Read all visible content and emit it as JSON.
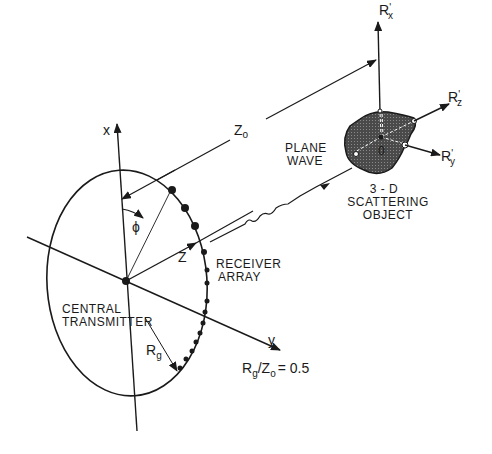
{
  "diagram": {
    "axes": {
      "x": "x",
      "y": "y",
      "z": "Z",
      "phi": "ϕ",
      "rx": "R",
      "rx_sub": "x",
      "ry": "R",
      "ry_sub": "y",
      "rz": "R",
      "rz_sub": "z",
      "prime": "'"
    },
    "labels": {
      "distance": "Z",
      "distance_sub": "o",
      "plane_wave_1": "PLANE",
      "plane_wave_2": "WAVE",
      "object_1": "3 - D",
      "object_2": "SCATTERING",
      "object_3": "OBJECT",
      "origin": "0",
      "receiver_1": "RECEIVER",
      "receiver_2": "ARRAY",
      "transmitter_1": "CENTRAL",
      "transmitter_2": "TRANSMITTER",
      "radius": "R",
      "radius_sub": "g",
      "ratio_r": "R",
      "ratio_r_sub": "g",
      "ratio_slash": "/",
      "ratio_z": "Z",
      "ratio_z_sub": "o",
      "ratio_value": "= 0.5"
    },
    "colors": {
      "ink": "#1a1a1a",
      "object_fill": "#555555"
    }
  }
}
